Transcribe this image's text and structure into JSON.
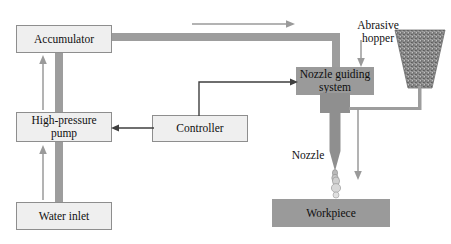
{
  "diagram": {
    "colors": {
      "box_fill_light": "#efefef",
      "box_border": "#8e8e8e",
      "box_fill_gray": "#9a9a9a",
      "pipe": "#9d9d9d",
      "line": "#5d5d5d",
      "hopper_fill": "#8f8f8f",
      "background": "#ffffff",
      "text": "#101010"
    },
    "nodes": [
      {
        "id": "accumulator",
        "label": "Accumulator",
        "style": "light",
        "x": 16,
        "y": 25,
        "w": 96,
        "h": 28
      },
      {
        "id": "high-pressure-pump",
        "label": "High-pressure\npump",
        "style": "light",
        "x": 16,
        "y": 112,
        "w": 96,
        "h": 30
      },
      {
        "id": "water-inlet",
        "label": "Water inlet",
        "style": "light",
        "x": 16,
        "y": 202,
        "w": 96,
        "h": 28
      },
      {
        "id": "controller",
        "label": "Controller",
        "style": "light",
        "x": 152,
        "y": 115,
        "w": 96,
        "h": 27
      },
      {
        "id": "nozzle-guiding-system",
        "label": "Nozzle guiding\nsystem",
        "style": "gray",
        "x": 296,
        "y": 67,
        "w": 78,
        "h": 28
      },
      {
        "id": "workpiece",
        "label": "Workpiece",
        "style": "gray",
        "x": 272,
        "y": 199,
        "w": 118,
        "h": 28
      }
    ],
    "labels": [
      {
        "id": "abrasive-hopper-label",
        "text": "Abrasive\nhopper",
        "x": 352,
        "y": 7,
        "w": 52
      },
      {
        "id": "nozzle-label",
        "text": "Nozzle",
        "x": 288,
        "y": 137,
        "w": 40
      }
    ],
    "flow_arrows": [
      {
        "id": "accumulator-outlet-flow-arrow",
        "direction": "right",
        "x1": 193,
        "y1": 24,
        "x2": 292,
        "y2": 24
      },
      {
        "id": "pump-to-accumulator-flow-arrow",
        "direction": "up",
        "x1": 43,
        "y1": 110,
        "x2": 43,
        "y2": 58
      },
      {
        "id": "inlet-to-pump-flow-arrow",
        "direction": "up",
        "x1": 43,
        "y1": 198,
        "x2": 43,
        "y2": 148
      },
      {
        "id": "abrasive-feed-flow-arrow",
        "direction": "down",
        "x1": 361,
        "y1": 42,
        "x2": 361,
        "y2": 66
      },
      {
        "id": "jet-direction-flow-arrow",
        "direction": "down",
        "x1": 358,
        "y1": 110,
        "x2": 358,
        "y2": 178
      }
    ],
    "control_arrows": [
      {
        "id": "controller-to-pump-arrow",
        "from": "controller",
        "to": "high-pressure-pump"
      },
      {
        "id": "controller-to-nozzle-arrow",
        "from": "controller",
        "to": "nozzle-guiding-system"
      }
    ],
    "pipes": [
      {
        "id": "accumulator-to-nozzle-pipe",
        "segments": "horizontal-then-down"
      },
      {
        "id": "accumulator-to-pump-pipe",
        "segments": "vertical"
      },
      {
        "id": "inlet-to-pump-pipe",
        "segments": "vertical"
      },
      {
        "id": "hopper-to-nozzle-tube",
        "segments": "down-then-left"
      }
    ],
    "hopper": {
      "id": "abrasive-hopper",
      "shape": "trapezoid",
      "x": 395,
      "y": 30,
      "w": 50,
      "h": 58
    },
    "nozzle": {
      "id": "nozzle-assembly",
      "block_x": 320,
      "block_y": 95,
      "block_w": 30,
      "block_h": 18,
      "tip_y": 172
    }
  }
}
